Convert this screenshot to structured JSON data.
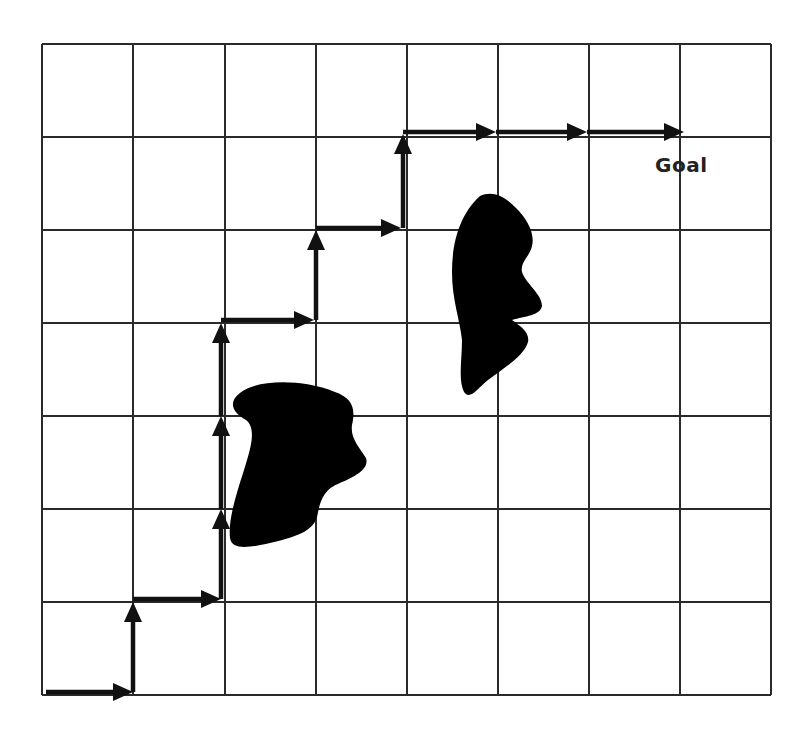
{
  "diagram": {
    "grid": {
      "columns": 8,
      "rows": 7,
      "x_lines": [
        42,
        133,
        225,
        316,
        407,
        498,
        589,
        680,
        771
      ],
      "y_lines": [
        44,
        137,
        230,
        323,
        416,
        509,
        602,
        695
      ],
      "line_color": "#2a2a2a",
      "background": "#ffffff"
    },
    "path": {
      "color": "#111111",
      "segments": [
        {
          "from": [
            46,
            692
          ],
          "to": [
            133,
            692
          ],
          "dir": "right"
        },
        {
          "from": [
            133,
            692
          ],
          "to": [
            133,
            602
          ],
          "dir": "up"
        },
        {
          "from": [
            133,
            599
          ],
          "to": [
            221,
            599
          ],
          "dir": "right"
        },
        {
          "from": [
            221,
            599
          ],
          "to": [
            221,
            509
          ],
          "dir": "up"
        },
        {
          "from": [
            221,
            509
          ],
          "to": [
            221,
            416
          ],
          "dir": "up"
        },
        {
          "from": [
            221,
            416
          ],
          "to": [
            221,
            323
          ],
          "dir": "up"
        },
        {
          "from": [
            221,
            320
          ],
          "to": [
            314,
            320
          ],
          "dir": "right"
        },
        {
          "from": [
            316,
            320
          ],
          "to": [
            316,
            230
          ],
          "dir": "up"
        },
        {
          "from": [
            316,
            228
          ],
          "to": [
            401,
            228
          ],
          "dir": "right"
        },
        {
          "from": [
            403,
            228
          ],
          "to": [
            403,
            134
          ],
          "dir": "up"
        },
        {
          "from": [
            403,
            132
          ],
          "to": [
            496,
            132
          ],
          "dir": "right"
        },
        {
          "from": [
            496,
            132
          ],
          "to": [
            587,
            132
          ],
          "dir": "right"
        },
        {
          "from": [
            587,
            132
          ],
          "to": [
            684,
            132
          ],
          "dir": "right"
        }
      ]
    },
    "obstacles": [
      {
        "name": "obstacle-lower-left",
        "svg_path": "M 240 393 C 255 380, 300 378, 335 392 C 352 398, 356 408, 352 425 C 350 438, 360 448, 366 458 C 370 470, 352 478, 338 484 C 322 490, 320 505, 318 512 C 316 530, 300 536, 270 543 C 248 548, 232 550, 230 538 C 228 520, 236 495, 244 470 C 252 445, 256 428, 246 420 C 232 412, 228 402, 240 393 Z"
      },
      {
        "name": "obstacle-upper-right",
        "svg_path": "M 480 196 C 492 190, 505 196, 516 208 C 528 220, 535 234, 532 246 C 530 256, 520 262, 522 272 C 526 284, 542 294, 542 306 C 540 316, 525 316, 512 320 C 520 326, 530 332, 528 342 C 524 356, 504 368, 488 380 C 476 390, 470 400, 464 392 C 458 380, 462 360, 462 340 C 460 320, 452 300, 452 272 C 452 246, 458 216, 480 196 Z"
      }
    ],
    "labels": {
      "goal": "Goal"
    }
  }
}
